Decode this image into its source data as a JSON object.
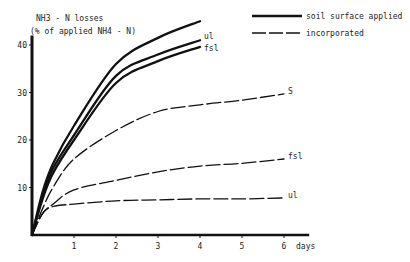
{
  "chart_data": {
    "type": "line",
    "title": "",
    "ylabel_line1": "NH3 - N losses",
    "ylabel_line2": "(% of applied NH4 - N)",
    "xlabel": "days",
    "xlim": [
      0,
      6.6
    ],
    "ylim": [
      0,
      42
    ],
    "x_ticks": [
      1,
      2,
      3,
      4,
      5,
      6
    ],
    "y_ticks": [
      10,
      20,
      30,
      40
    ],
    "grid": false,
    "legend_position": "top-right",
    "legend": [
      {
        "label": "soil surface applied",
        "style": "solid"
      },
      {
        "label": "incorporated",
        "style": "dashed"
      }
    ],
    "series": [
      {
        "name": "s (soil surface applied)",
        "group": "soil surface applied",
        "label": "",
        "style": "solid",
        "x": [
          0,
          0.25,
          0.5,
          1,
          2,
          3,
          4
        ],
        "y": [
          0,
          9,
          15,
          23,
          36,
          41.5,
          45
        ]
      },
      {
        "name": "ul (soil surface applied)",
        "group": "soil surface applied",
        "label": "ul",
        "style": "solid",
        "x": [
          0,
          0.25,
          0.5,
          1,
          2,
          3,
          4
        ],
        "y": [
          0,
          8,
          14,
          21,
          33.5,
          38,
          41
        ]
      },
      {
        "name": "fsl (soil surface applied)",
        "group": "soil surface applied",
        "label": "fsl",
        "style": "solid",
        "x": [
          0,
          0.25,
          0.5,
          1,
          2,
          3,
          4
        ],
        "y": [
          0,
          7.5,
          13,
          20,
          32,
          36.6,
          39.6
        ]
      },
      {
        "name": "S (incorporated)",
        "group": "incorporated",
        "label": "S",
        "style": "dashed",
        "x": [
          0,
          0.25,
          0.5,
          1,
          2,
          3,
          4,
          5,
          6
        ],
        "y": [
          0,
          5.5,
          10,
          16,
          22,
          26,
          27.4,
          28.4,
          29.7
        ]
      },
      {
        "name": "fsl (incorporated)",
        "group": "incorporated",
        "label": "fsl",
        "style": "dashed",
        "x": [
          0,
          0.25,
          0.5,
          1,
          2,
          3,
          4,
          5,
          6
        ],
        "y": [
          0,
          4.5,
          6.5,
          9.5,
          11.5,
          13.3,
          14.5,
          15.1,
          16
        ]
      },
      {
        "name": "ul (incorporated)",
        "group": "incorporated",
        "label": "ul",
        "style": "dashed",
        "x": [
          0,
          0.25,
          0.5,
          1,
          2,
          3,
          4,
          5,
          6
        ],
        "y": [
          0,
          4.5,
          6,
          6.5,
          7.2,
          7.4,
          7.6,
          7.6,
          7.8
        ]
      }
    ]
  }
}
